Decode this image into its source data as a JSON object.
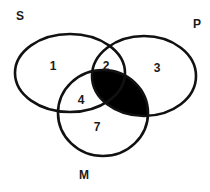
{
  "diagram": {
    "type": "venn",
    "sets": [
      {
        "id": "S",
        "label": "S"
      },
      {
        "id": "P",
        "label": "P"
      },
      {
        "id": "M",
        "label": "M"
      }
    ],
    "regions": [
      {
        "id": "S_only",
        "label": "1"
      },
      {
        "id": "S_and_P_only",
        "label": "2"
      },
      {
        "id": "P_only",
        "label": "3"
      },
      {
        "id": "S_and_M_only",
        "label": "4"
      },
      {
        "id": "M_only",
        "label": "7"
      },
      {
        "id": "P_and_M",
        "label": "",
        "shaded": true
      }
    ],
    "colors": {
      "stroke": "#111111",
      "shade": "#000000",
      "background": "#ffffff"
    }
  }
}
